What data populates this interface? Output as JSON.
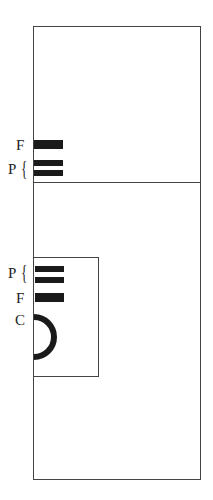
{
  "diagram": {
    "top_section": {
      "labels": {
        "F": "F",
        "P": "P"
      },
      "brace": "{"
    },
    "inner_section": {
      "labels": {
        "P": "P",
        "F": "F",
        "C": "C"
      },
      "brace": "{"
    },
    "colors": {
      "bar": "#1a1a1a",
      "outline": "#444444"
    }
  }
}
